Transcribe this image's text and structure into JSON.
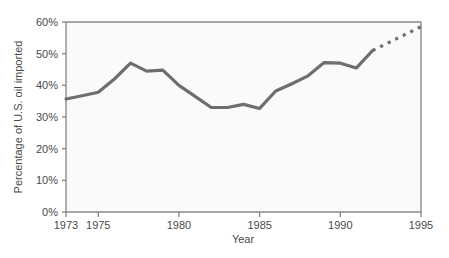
{
  "chart_data": {
    "type": "line",
    "title": "",
    "xlabel": "Year",
    "ylabel": "Percentage of U.S. oil imported",
    "xlim": [
      1973,
      1995
    ],
    "ylim": [
      0,
      60
    ],
    "grid": false,
    "legend": "none",
    "xtick_labels": [
      "1973",
      "1975",
      "1980",
      "1985",
      "1990",
      "1995"
    ],
    "xtick_values": [
      1973,
      1975,
      1980,
      1985,
      1990,
      1995
    ],
    "ytick_labels": [
      "0%",
      "10%",
      "20%",
      "30%",
      "40%",
      "50%",
      "60%"
    ],
    "ytick_values": [
      0,
      10,
      20,
      30,
      40,
      50,
      60
    ],
    "line_color": "#6e6e6e",
    "plot_bg_color": "#fafafa",
    "axis_color": "#8a8a8a",
    "series": [
      {
        "name": "Percentage of U.S. oil imported",
        "style": "solid",
        "x": [
          1973,
          1974,
          1975,
          1976,
          1977,
          1978,
          1979,
          1980,
          1981,
          1982,
          1983,
          1984,
          1985,
          1986,
          1987,
          1988,
          1989,
          1990,
          1991,
          1992
        ],
        "values": [
          35.7,
          36.7,
          37.8,
          42.0,
          47.0,
          44.5,
          44.8,
          40.0,
          36.5,
          33.0,
          33.0,
          34.0,
          32.7,
          38.2,
          40.5,
          43.0,
          47.2,
          47.0,
          45.5,
          51.0
        ]
      },
      {
        "name": "Projection",
        "style": "dashed",
        "x": [
          1992,
          1993,
          1994,
          1995
        ],
        "values": [
          51.0,
          53.5,
          56.0,
          58.5
        ]
      }
    ]
  },
  "axis_labels": {
    "y_title": "Percentage of U.S. oil imported",
    "x_title": "Year",
    "y_ticks": [
      "60%",
      "50%",
      "40%",
      "30%",
      "20%",
      "10%",
      "0%"
    ],
    "x_ticks": [
      "1973",
      "1975",
      "1980",
      "1985",
      "1990",
      "1995"
    ]
  }
}
